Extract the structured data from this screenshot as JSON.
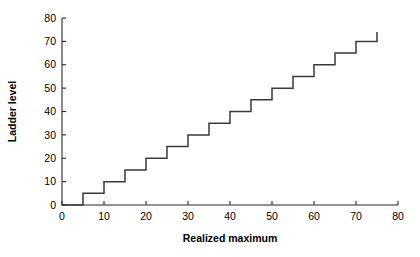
{
  "chart_data": {
    "type": "line",
    "title": "",
    "subtitle": "",
    "xlabel": "Realized maximum",
    "ylabel": "Ladder level",
    "xlim": [
      0,
      80
    ],
    "ylim": [
      0,
      80
    ],
    "xticks": [
      0,
      10,
      20,
      30,
      40,
      50,
      60,
      70,
      80
    ],
    "yticks": [
      0,
      10,
      20,
      30,
      40,
      50,
      60,
      70,
      80
    ],
    "xtick_labels": [
      "0",
      "10",
      "20",
      "30",
      "40",
      "50",
      "60",
      "70",
      "80"
    ],
    "ytick_labels": [
      "0",
      "10",
      "20",
      "30",
      "40",
      "50",
      "60",
      "70",
      "80"
    ],
    "grid": false,
    "legend": null,
    "line_color": "#3a3a3a",
    "axis_color": "#2a2a2a",
    "background": "#ffffff",
    "step_style": "post",
    "series": [
      {
        "name": "Ladder level",
        "x": [
          0,
          5,
          5,
          10,
          10,
          15,
          15,
          20,
          20,
          25,
          25,
          30,
          30,
          35,
          35,
          40,
          40,
          45,
          45,
          50,
          50,
          55,
          55,
          60,
          60,
          65,
          65,
          70,
          70,
          75,
          75
        ],
        "y": [
          0,
          0,
          5,
          5,
          10,
          10,
          15,
          15,
          20,
          20,
          25,
          25,
          30,
          30,
          35,
          35,
          40,
          40,
          45,
          45,
          50,
          50,
          55,
          55,
          60,
          60,
          65,
          65,
          70,
          70,
          74
        ],
        "steps": [
          {
            "realized_maximum": 5,
            "ladder_level": 5
          },
          {
            "realized_maximum": 10,
            "ladder_level": 10
          },
          {
            "realized_maximum": 15,
            "ladder_level": 15
          },
          {
            "realized_maximum": 20,
            "ladder_level": 20
          },
          {
            "realized_maximum": 25,
            "ladder_level": 25
          },
          {
            "realized_maximum": 30,
            "ladder_level": 30
          },
          {
            "realized_maximum": 35,
            "ladder_level": 35
          },
          {
            "realized_maximum": 40,
            "ladder_level": 40
          },
          {
            "realized_maximum": 45,
            "ladder_level": 45
          },
          {
            "realized_maximum": 50,
            "ladder_level": 50
          },
          {
            "realized_maximum": 55,
            "ladder_level": 55
          },
          {
            "realized_maximum": 60,
            "ladder_level": 60
          },
          {
            "realized_maximum": 65,
            "ladder_level": 65
          },
          {
            "realized_maximum": 70,
            "ladder_level": 70
          },
          {
            "realized_maximum": 75,
            "ladder_level": 75
          }
        ]
      }
    ]
  }
}
